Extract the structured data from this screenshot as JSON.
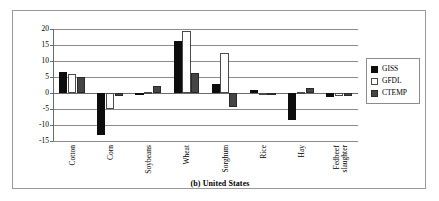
{
  "figure": {
    "caption": "(b)  United States"
  },
  "chart_data": {
    "type": "bar",
    "title": "(b)  United States",
    "xlabel": "",
    "ylabel": "",
    "ylim": [
      -15,
      20
    ],
    "yticks": [
      20,
      15,
      10,
      5,
      0,
      -5,
      -10,
      -15
    ],
    "ytick_labels": [
      "20",
      "15",
      "10",
      "5",
      "0",
      "-5",
      "-10",
      "-15"
    ],
    "grid": true,
    "legend_position": "right",
    "categories": [
      "Cotton",
      "Corn",
      "Soybeans",
      "Wheat",
      "Sorghum",
      "Rice",
      "Hay",
      "Fedbeef slaughter"
    ],
    "category_lines": [
      [
        "Cotton"
      ],
      [
        "Corn"
      ],
      [
        "Soybeans"
      ],
      [
        "Wheat"
      ],
      [
        "Sorghum"
      ],
      [
        "Rice"
      ],
      [
        "Hay"
      ],
      [
        "Fedbeef",
        "slaughter"
      ]
    ],
    "series": [
      {
        "name": "GISS",
        "color": "#0d0d0d",
        "values": [
          6.7,
          -13.0,
          0.1,
          16.2,
          2.9,
          0.9,
          -8.5,
          -1.4
        ]
      },
      {
        "name": "GFDL",
        "color": "#ffffff",
        "values": [
          6.0,
          -5.1,
          0.3,
          19.4,
          12.6,
          0.1,
          0.3,
          -0.8
        ]
      },
      {
        "name": "CTEMP",
        "color": "#454545",
        "values": [
          4.9,
          -1.0,
          2.2,
          6.3,
          -4.3,
          -0.5,
          1.5,
          -1.0
        ]
      }
    ]
  },
  "legend": {
    "items": [
      {
        "label": "GISS"
      },
      {
        "label": "GFDL"
      },
      {
        "label": "CTEMP"
      }
    ]
  }
}
